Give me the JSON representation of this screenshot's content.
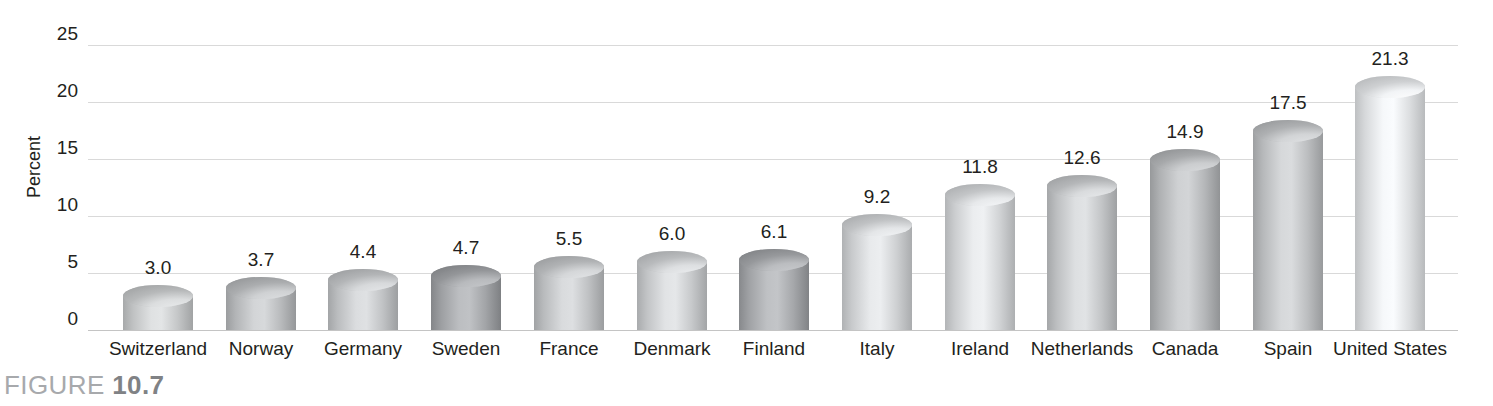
{
  "caption": {
    "prefix": "FIGURE",
    "number": "10.7"
  },
  "chart_data": {
    "type": "bar",
    "title": "",
    "subtitle": "",
    "xlabel": "",
    "ylabel": "Percent",
    "ylim": [
      0,
      25
    ],
    "yticks": [
      "25",
      "20",
      "15",
      "10",
      "5",
      "0"
    ],
    "ytick_values": [
      25,
      20,
      15,
      10,
      5,
      0
    ],
    "grid": true,
    "legend": "none",
    "categories": [
      "Switzerland",
      "Norway",
      "Germany",
      "Sweden",
      "France",
      "Denmark",
      "Finland",
      "Italy",
      "Ireland",
      "Netherlands",
      "Canada",
      "Spain",
      "United States"
    ],
    "values": [
      3.0,
      3.7,
      4.4,
      4.7,
      5.5,
      6.0,
      6.1,
      9.2,
      11.8,
      12.6,
      14.9,
      17.5,
      21.3
    ],
    "value_labels": [
      "3.0",
      "3.7",
      "4.4",
      "4.7",
      "5.5",
      "6.0",
      "6.1",
      "9.2",
      "11.8",
      "12.6",
      "14.9",
      "17.5",
      "21.3"
    ],
    "bar_style": "cylinder",
    "bar_colors": [
      "#c9cbcc",
      "#bdbfc1",
      "#c5c7c9",
      "#a6a8ab",
      "#c3c5c7",
      "#cbcdcf",
      "#a9abae",
      "#d2d4d6",
      "#d5d7d9",
      "#c7c9cb",
      "#b9bbbd",
      "#c0c2c4",
      "#e0e2e4"
    ],
    "gridline_color": "#d9d9d9",
    "axis_color": "#c4c4c4",
    "text_color": "#231f20"
  }
}
